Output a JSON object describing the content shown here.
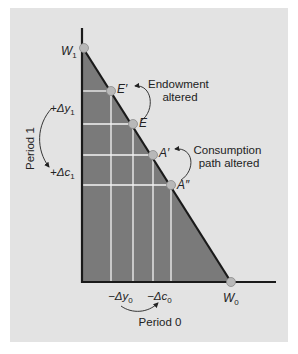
{
  "diagram": {
    "type": "intertemporal-budget-constraint",
    "axes": {
      "x_label": "Period 0",
      "y_label": "Period 1",
      "x_intercept_label": "W",
      "x_intercept_sub": "0",
      "y_intercept_label": "W",
      "y_intercept_sub": "1"
    },
    "points": [
      {
        "id": "W1",
        "label": "W",
        "sub": "1"
      },
      {
        "id": "E_prime",
        "label": "E′"
      },
      {
        "id": "E",
        "label": "E"
      },
      {
        "id": "A_prime",
        "label": "A′"
      },
      {
        "id": "A_dprime",
        "label": "A″"
      },
      {
        "id": "W0",
        "label": "W",
        "sub": "0"
      }
    ],
    "annotations": {
      "endowment_line1": "Endowment",
      "endowment_line2": "altered",
      "consumption_line1": "Consumption",
      "consumption_line2": "path altered",
      "delta_y1": "+Δy",
      "delta_y1_sub": "1",
      "delta_c1": "+Δc",
      "delta_c1_sub": "1",
      "delta_y0": "−Δy",
      "delta_y0_sub": "0",
      "delta_c0": "−Δc",
      "delta_c0_sub": "0"
    },
    "colors": {
      "panel": "#e3e3e3",
      "shaded_region": "#7a7a7a",
      "axis": "#1a1a1a",
      "grid": "#f4f4f4",
      "point": "#b8b8b8"
    }
  }
}
